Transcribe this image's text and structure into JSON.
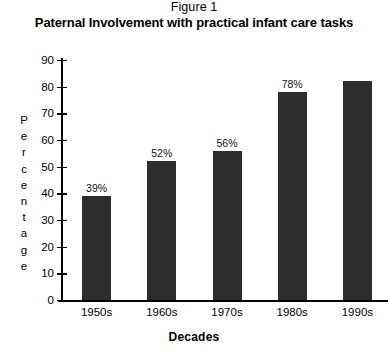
{
  "figure": {
    "caption": "Figure 1",
    "title": "Paternal Involvement with practical infant care tasks"
  },
  "chart_data": {
    "type": "bar",
    "title": "Paternal Involvement with practical infant care tasks",
    "subtitle": "Figure 1",
    "xlabel": "Decades",
    "ylabel": "Percentage",
    "ylim": [
      0,
      90
    ],
    "ytick_step": 10,
    "yticks": [
      0,
      10,
      20,
      30,
      40,
      50,
      60,
      70,
      80,
      90
    ],
    "ytick_labels": [
      "0",
      "10",
      "20",
      "30",
      "40",
      "50",
      "60",
      "70",
      "80",
      "90"
    ],
    "categories": [
      "1950s",
      "1960s",
      "1970s",
      "1980s",
      "1990s"
    ],
    "values": [
      39,
      52,
      56,
      78,
      82
    ],
    "data_labels": [
      "39%",
      "52%",
      "56%",
      "78%",
      ""
    ],
    "grid": false,
    "legend": false,
    "bar_color": "#2d2d2d",
    "axis_color": "#000000",
    "background": "#ffffff"
  }
}
